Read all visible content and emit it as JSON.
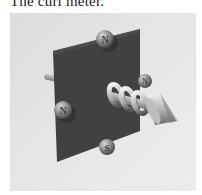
{
  "caption": "The curl meter.",
  "figure": {
    "balls": [
      {
        "position": "top",
        "label": "N"
      },
      {
        "position": "right",
        "label": "N"
      },
      {
        "position": "left",
        "label": "N"
      },
      {
        "position": "bottom",
        "label": "S"
      }
    ],
    "colors": {
      "background": "#e3e3e3",
      "plate": "#3f3f3f",
      "ball": "#8a8a8a",
      "axis": "#b8b8b8"
    }
  }
}
